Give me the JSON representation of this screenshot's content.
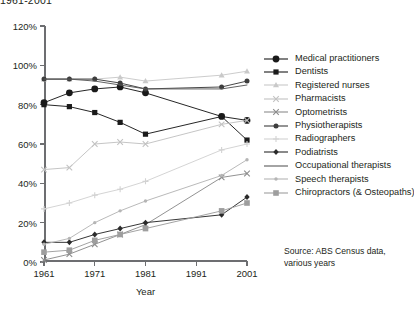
{
  "title": "1961-2001",
  "source": {
    "line1": "Source: ABS Census data,",
    "line2": "various years"
  },
  "axes": {
    "xlabel": "Year",
    "ylabel": "",
    "yticklabels": [
      "0%",
      "20%",
      "40%",
      "60%",
      "80%",
      "100%",
      "120%"
    ],
    "xticklabels": [
      "1961",
      "1971",
      "1981",
      "1991",
      "2001"
    ]
  },
  "chart_data": {
    "type": "line",
    "title": "1961-2001",
    "xlabel": "Year",
    "ylabel": "",
    "xlim": [
      1961,
      2001
    ],
    "ylim": [
      0,
      120
    ],
    "yticks": [
      0,
      20,
      40,
      60,
      80,
      100,
      120
    ],
    "xticks": [
      1961,
      1971,
      1981,
      1991,
      2001
    ],
    "ytickformat": "percent",
    "grid": false,
    "legend_position": "right",
    "x": [
      1961,
      1966,
      1971,
      1976,
      1981,
      1996,
      2001
    ],
    "series": [
      {
        "name": "Medical practitioners",
        "color": "#1a1a1a",
        "marker": "circle-large",
        "values": [
          81,
          86,
          88,
          89,
          86,
          74,
          72
        ]
      },
      {
        "name": "Dentists",
        "color": "#1a1a1a",
        "marker": "square",
        "values": [
          80,
          79,
          76,
          71,
          65,
          74,
          62
        ]
      },
      {
        "name": "Registered nurses",
        "color": "#c9c9c9",
        "marker": "triangle",
        "values": [
          93,
          93,
          93,
          94,
          92,
          95,
          97
        ]
      },
      {
        "name": "Pharmacists",
        "color": "#c2c2c2",
        "marker": "x-light",
        "values": [
          47,
          48,
          60,
          61,
          60,
          70,
          72
        ]
      },
      {
        "name": "Optometrists",
        "color": "#8c8c8c",
        "marker": "x",
        "values": [
          1,
          4,
          9,
          14,
          19,
          43,
          45
        ]
      },
      {
        "name": "Physiotherapists",
        "color": "#3d3d3d",
        "marker": "circle",
        "values": [
          93,
          93,
          93,
          91,
          88,
          89,
          92
        ]
      },
      {
        "name": "Radiographers",
        "color": "#d2d2d2",
        "marker": "plus",
        "values": [
          27,
          30,
          34,
          37,
          41,
          57,
          60
        ]
      },
      {
        "name": "Podiatrists",
        "color": "#2b2b2b",
        "marker": "diamond",
        "values": [
          10,
          10,
          14,
          17,
          20,
          24,
          33
        ]
      },
      {
        "name": "Occupational therapists",
        "color": "#5a5a5a",
        "marker": "line",
        "values": [
          93,
          93,
          92,
          90,
          88,
          88,
          90
        ]
      },
      {
        "name": "Speech therapists",
        "color": "#b5b5b5",
        "marker": "dot",
        "values": [
          9,
          12,
          20,
          26,
          31,
          44,
          52
        ]
      },
      {
        "name": "Chiropractors (& Osteopaths)",
        "color": "#9e9e9e",
        "marker": "square-light",
        "values": [
          5,
          6,
          11,
          14,
          17,
          26,
          30
        ]
      }
    ]
  }
}
